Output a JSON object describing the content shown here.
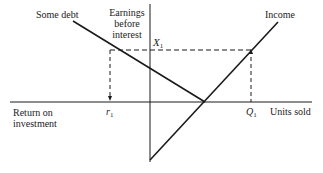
{
  "diagram": {
    "labels": {
      "some_debt": "Some debt",
      "earnings_line1": "Earnings",
      "earnings_line2": "before",
      "earnings_line3": "interest",
      "income": "Income",
      "x1": "X",
      "x1_sub": "1",
      "r1": "r",
      "r1_sub": "1",
      "q1": "Q",
      "q1_sub": "1",
      "return_line1": "Return on",
      "return_line2": "investment",
      "units_sold": "Units sold"
    },
    "colors": {
      "line": "#1a1a1a",
      "text": "#222222",
      "background": "#ffffff"
    }
  }
}
